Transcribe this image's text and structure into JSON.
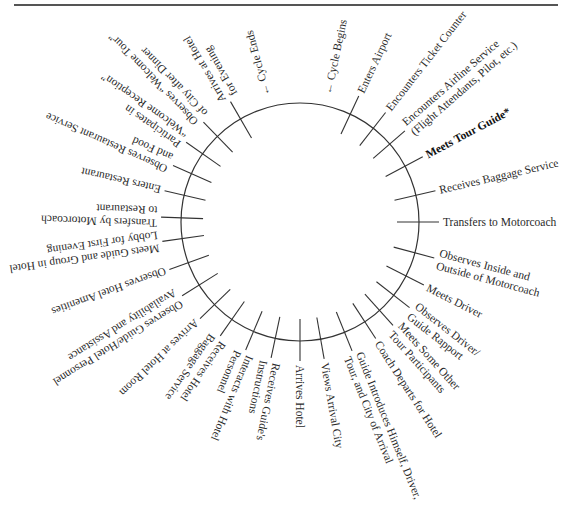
{
  "diagram": {
    "type": "cycle",
    "center": [
      300,
      222
    ],
    "radius": 119,
    "markers": {
      "start": {
        "label": "← Cycle Begins",
        "angle": 12
      },
      "end": {
        "label": "← Cycle Ends",
        "angle": 345
      }
    },
    "steps": [
      {
        "angle": 25,
        "lines": [
          "Enters Airport"
        ]
      },
      {
        "angle": 38,
        "lines": [
          "Encounters Ticket Counter"
        ]
      },
      {
        "angle": 49,
        "lines": [
          "Encounters Airline Service",
          "(Flight Attendants, Pilot, etc.)"
        ]
      },
      {
        "angle": 62,
        "lines": [
          "Meets Tour Guide*"
        ],
        "bold": true
      },
      {
        "angle": 77,
        "lines": [
          "Receives Baggage Service"
        ]
      },
      {
        "angle": 90,
        "lines": [
          "Transfers to Motorcoach"
        ]
      },
      {
        "angle": 105,
        "lines": [
          "Observes Inside and",
          "Outside of Motorcoach"
        ]
      },
      {
        "angle": 117,
        "lines": [
          "Meets Driver"
        ]
      },
      {
        "angle": 128,
        "lines": [
          "Observes Driver/",
          "Guide Rapport"
        ]
      },
      {
        "angle": 138,
        "lines": [
          "Meets Some Other",
          "Tour Participants"
        ]
      },
      {
        "angle": 147,
        "lines": [
          "Coach Departs for Hotel"
        ]
      },
      {
        "angle": 158,
        "lines": [
          "Guide Introduces Himself, Driver,",
          "Tour, and City of Arrival"
        ]
      },
      {
        "angle": 170,
        "lines": [
          "Views Arrival City"
        ]
      },
      {
        "angle": 180,
        "lines": [
          "Arrives Hotel"
        ]
      },
      {
        "angle": 192,
        "lines": [
          "Receives Guide's",
          "Instructions"
        ]
      },
      {
        "angle": 203,
        "lines": [
          "Interacts with Hotel",
          "Personnel"
        ]
      },
      {
        "angle": 215,
        "lines": [
          "Receives Hotel",
          "Baggage Service"
        ]
      },
      {
        "angle": 226,
        "lines": [
          "Arrives at Hotel Room"
        ]
      },
      {
        "angle": 238,
        "lines": [
          "Observes Guide/Hotel Personnel",
          "Availability and Assistance"
        ]
      },
      {
        "angle": 250,
        "lines": [
          "Observes Hotel Amenities"
        ]
      },
      {
        "angle": 262,
        "lines": [
          "Meets Guide and Group in Hotel",
          "Lobby for First Evening"
        ]
      },
      {
        "angle": 272,
        "lines": [
          "Transfers by Motorcoach",
          "to Restaurant"
        ]
      },
      {
        "angle": 283,
        "lines": [
          "Enters Restaurant"
        ]
      },
      {
        "angle": 294,
        "lines": [
          "Observes Restaurant Service",
          "and Food"
        ]
      },
      {
        "angle": 305,
        "lines": [
          "Participates in",
          "“Welcome Reception”"
        ]
      },
      {
        "angle": 316,
        "lines": [
          "Observes “Welcome Tour”",
          "of City after Dinner"
        ]
      },
      {
        "angle": 330,
        "lines": [
          "Arrives at Hotel",
          "for Evening"
        ]
      }
    ]
  }
}
